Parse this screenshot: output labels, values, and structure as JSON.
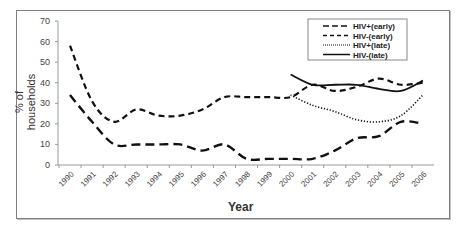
{
  "chart_data": {
    "type": "line",
    "title": "",
    "xlabel": "Year",
    "ylabel": "% of households",
    "ylim": [
      0,
      70
    ],
    "yticks": [
      0,
      10,
      20,
      30,
      40,
      50,
      60,
      70
    ],
    "categories": [
      "1990",
      "1991",
      "1992",
      "1993",
      "1994",
      "1995",
      "1996",
      "1997",
      "1998",
      "1999",
      "2000",
      "2001",
      "2002",
      "2003",
      "2004",
      "2005",
      "2006"
    ],
    "grid": false,
    "legend_position": "top-right",
    "series": [
      {
        "name": "HIV+(early)",
        "style": "long-dash",
        "values": [
          34,
          21,
          10,
          10,
          10,
          10,
          7,
          10,
          3,
          3,
          3,
          3,
          7,
          13,
          14,
          21,
          20
        ]
      },
      {
        "name": "HIV-(early)",
        "style": "short-dash",
        "values": [
          58,
          31,
          21,
          27,
          24,
          24,
          27,
          33,
          33,
          33,
          33,
          39,
          36,
          38,
          42,
          39,
          40
        ]
      },
      {
        "name": "HIV+(late)",
        "style": "dotted",
        "values": [
          null,
          null,
          null,
          null,
          null,
          null,
          null,
          null,
          null,
          null,
          34,
          29,
          26,
          22,
          21,
          24,
          34
        ]
      },
      {
        "name": "HIV-(late)",
        "style": "solid",
        "values": [
          null,
          null,
          null,
          null,
          null,
          null,
          null,
          null,
          null,
          null,
          44,
          39,
          39,
          39,
          37,
          36,
          41
        ]
      }
    ]
  }
}
